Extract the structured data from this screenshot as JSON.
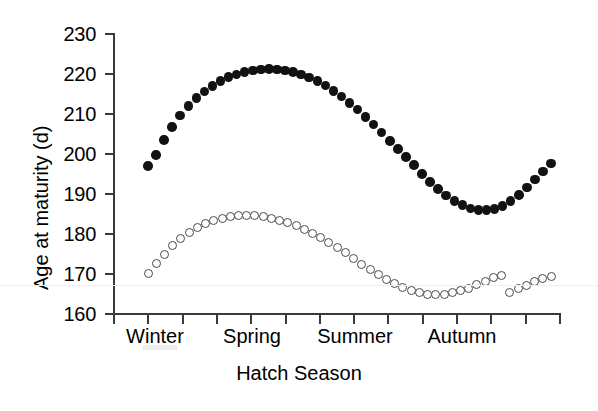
{
  "chart_data": {
    "type": "scatter",
    "title": "",
    "xlabel": "Hatch Season",
    "ylabel": "Age at maturity (d)",
    "ylim": [
      160,
      230
    ],
    "yticks": [
      160,
      170,
      180,
      190,
      200,
      210,
      220,
      230
    ],
    "grid": false,
    "legend": "none",
    "categories": [
      "Winter",
      "Spring",
      "Summer",
      "Autumn"
    ],
    "x_tick_count": 14,
    "x_axis_note": "14 unlabeled evenly spaced ticks spanning the four hatch seasons",
    "series": [
      {
        "name": "filled-circles",
        "marker": "filled circle",
        "color": "#121212",
        "x": [
          1,
          2,
          3,
          4,
          5,
          6,
          7,
          8,
          9,
          10,
          11,
          12,
          13,
          14,
          15,
          16,
          17,
          18,
          19,
          20,
          21,
          22,
          23,
          24,
          25,
          26,
          27,
          28,
          29,
          30,
          31,
          32,
          33,
          34,
          35,
          36,
          37,
          38,
          39,
          40,
          41,
          42,
          43,
          44
        ],
        "values": [
          197.0,
          199.8,
          203.5,
          206.8,
          209.6,
          212.0,
          214.0,
          215.6,
          217.0,
          218.2,
          219.2,
          219.9,
          220.5,
          220.9,
          221.1,
          221.2,
          221.1,
          220.9,
          220.5,
          219.9,
          219.1,
          218.2,
          217.1,
          215.8,
          214.4,
          212.8,
          211.1,
          209.3,
          207.4,
          205.4,
          203.3,
          201.2,
          199.2,
          197.3,
          195.0,
          193.0,
          191.2,
          189.6,
          188.3,
          187.2,
          186.4,
          186.0,
          186.0,
          186.3
        ]
      },
      {
        "name": "open-circles",
        "marker": "open circle",
        "color": "#4a4a4a",
        "x": [
          1,
          2,
          3,
          4,
          5,
          6,
          7,
          8,
          9,
          10,
          11,
          12,
          13,
          14,
          15,
          16,
          17,
          18,
          19,
          20,
          21,
          22,
          23,
          24,
          25,
          26,
          27,
          28,
          29,
          30,
          31,
          32,
          33,
          34,
          35,
          36,
          37,
          38,
          39,
          40,
          41,
          42,
          43,
          44
        ],
        "values": [
          170.2,
          172.6,
          175.0,
          177.1,
          178.9,
          180.4,
          181.6,
          182.6,
          183.4,
          184.0,
          184.4,
          184.6,
          184.7,
          184.6,
          184.4,
          184.0,
          183.5,
          182.9,
          182.1,
          181.2,
          180.2,
          179.1,
          177.9,
          176.6,
          175.3,
          173.9,
          172.5,
          171.2,
          169.9,
          168.7,
          167.6,
          166.7,
          166.0,
          165.4,
          165.0,
          164.9,
          165.0,
          165.3,
          165.8,
          166.5,
          167.3,
          168.2,
          169.1,
          169.6
        ]
      }
    ],
    "series_tail": {
      "note": "both series continue upward at the far right edge",
      "filled_tail": [
        187.0,
        188.2,
        189.8,
        191.6,
        193.6,
        195.6,
        197.6
      ],
      "open_tail": [
        165.5,
        166.3,
        167.2,
        168.2,
        169.0,
        169.5
      ]
    }
  },
  "axis": {
    "y_labels": [
      "230",
      "220",
      "210",
      "200",
      "190",
      "180",
      "170",
      "160"
    ],
    "y_title": "Age at maturity (d)",
    "x_title": "Hatch Season",
    "season_labels": [
      "Winter",
      "Spring",
      "Summer",
      "Autumn"
    ]
  }
}
